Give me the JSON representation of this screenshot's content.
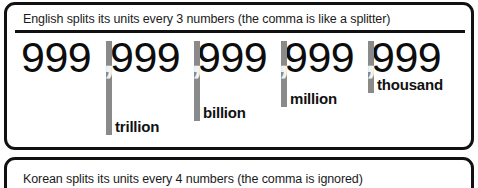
{
  "panels": {
    "english": {
      "caption": "English splits its units every 3 numbers (the comma is like a splitter)",
      "number_display": "999,999,999,999,999",
      "groups": [
        {
          "digits": "999"
        },
        {
          "digits": "999"
        },
        {
          "digits": "999"
        },
        {
          "digits": "999"
        },
        {
          "digits": "999"
        }
      ],
      "separators": [
        {
          "symbol": ",",
          "label": "trillion"
        },
        {
          "symbol": ",",
          "label": "billion"
        },
        {
          "symbol": ",",
          "label": "million"
        },
        {
          "symbol": ",",
          "label": "thousand"
        }
      ]
    },
    "korean": {
      "caption": "Korean splits its units every 4 numbers (the comma is ignored)"
    }
  },
  "colors": {
    "border": "#111111",
    "text": "#1b1b1b",
    "digit": "#0d0d0d",
    "separator_bar": "#8a8a8a",
    "comma": "#f2f2f2",
    "background": "#ffffff"
  }
}
